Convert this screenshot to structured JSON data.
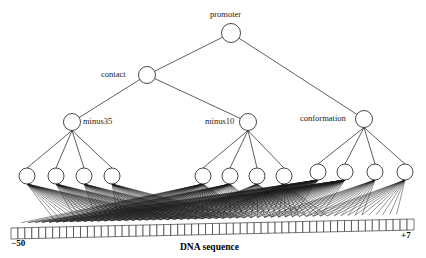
{
  "figure": {
    "type": "bayesian-network-diagram",
    "title_visible": false,
    "background_color": "#ffffff",
    "stroke_color": "#1a1a1a",
    "node_fill": "#ffffff",
    "width": 426,
    "height": 258
  },
  "nodes": {
    "root": {
      "label": "promoter",
      "x": 231,
      "y": 33,
      "r": 9.5,
      "label_pos": "above"
    },
    "contact": {
      "label": "contact",
      "x": 147,
      "y": 75,
      "r": 8.5,
      "label_pos": "left"
    },
    "minus35": {
      "label": "minus35",
      "x": 72,
      "y": 122,
      "r": 8.5,
      "label_pos": "right"
    },
    "minus10": {
      "label": "minus10",
      "x": 248,
      "y": 122,
      "r": 8.5,
      "label_pos": "left"
    },
    "conformation": {
      "label": "conformation",
      "x": 364,
      "y": 119,
      "r": 8.5,
      "label_pos": "left"
    }
  },
  "leaves": {
    "minus35_children": [
      {
        "x": 27,
        "y": 176,
        "r": 8
      },
      {
        "x": 56,
        "y": 176,
        "r": 8
      },
      {
        "x": 84,
        "y": 176,
        "r": 8
      },
      {
        "x": 112,
        "y": 176,
        "r": 8
      }
    ],
    "minus10_children": [
      {
        "x": 203,
        "y": 176,
        "r": 8
      },
      {
        "x": 230,
        "y": 176,
        "r": 8
      },
      {
        "x": 257,
        "y": 176,
        "r": 8
      },
      {
        "x": 284,
        "y": 176,
        "r": 8
      }
    ],
    "conformation_children": [
      {
        "x": 318,
        "y": 172,
        "r": 8
      },
      {
        "x": 345,
        "y": 172,
        "r": 8
      },
      {
        "x": 375,
        "y": 172,
        "r": 8
      },
      {
        "x": 405,
        "y": 172,
        "r": 8
      }
    ]
  },
  "sequence_bar": {
    "cell_count": 58,
    "x_left": 11,
    "x_right": 414,
    "y_left_top": 228,
    "y_right_top": 219,
    "cell_height": 11,
    "left_tick_label": "−50",
    "right_tick_label": "+7"
  },
  "caption": {
    "text": "DNA sequence",
    "x": 213,
    "y": 248
  },
  "edges": {
    "tree": [
      {
        "from": "root",
        "to": "contact"
      },
      {
        "from": "root",
        "to": "conformation"
      },
      {
        "from": "contact",
        "to": "minus35"
      },
      {
        "from": "contact",
        "to": "minus10"
      }
    ],
    "parent_to_leaf_groups": [
      {
        "parent": "minus35",
        "group": "minus35_children"
      },
      {
        "parent": "minus10",
        "group": "minus10_children"
      },
      {
        "parent": "conformation",
        "group": "conformation_children"
      }
    ]
  },
  "leaf_to_sequence_fans": [
    {
      "leaf_group": "minus35_children",
      "leaf_index": 0,
      "cell_start": 6,
      "cell_end": 24
    },
    {
      "leaf_group": "minus35_children",
      "leaf_index": 1,
      "cell_start": 9,
      "cell_end": 27
    },
    {
      "leaf_group": "minus35_children",
      "leaf_index": 2,
      "cell_start": 12,
      "cell_end": 30
    },
    {
      "leaf_group": "minus35_children",
      "leaf_index": 3,
      "cell_start": 15,
      "cell_end": 33
    },
    {
      "leaf_group": "minus10_children",
      "leaf_index": 0,
      "cell_start": 1,
      "cell_end": 34
    },
    {
      "leaf_group": "minus10_children",
      "leaf_index": 1,
      "cell_start": 4,
      "cell_end": 37
    },
    {
      "leaf_group": "minus10_children",
      "leaf_index": 2,
      "cell_start": 22,
      "cell_end": 42
    },
    {
      "leaf_group": "minus10_children",
      "leaf_index": 3,
      "cell_start": 26,
      "cell_end": 45
    },
    {
      "leaf_group": "conformation_children",
      "leaf_index": 0,
      "cell_start": 2,
      "cell_end": 40
    },
    {
      "leaf_group": "conformation_children",
      "leaf_index": 1,
      "cell_start": 5,
      "cell_end": 44
    },
    {
      "leaf_group": "conformation_children",
      "leaf_index": 2,
      "cell_start": 36,
      "cell_end": 50
    },
    {
      "leaf_group": "conformation_children",
      "leaf_index": 3,
      "cell_start": 42,
      "cell_end": 55
    }
  ]
}
